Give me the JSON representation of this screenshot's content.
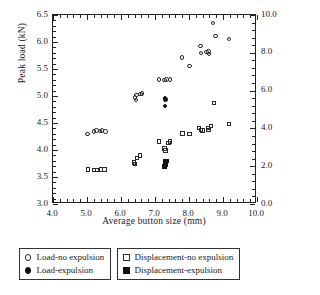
{
  "chart_data": {
    "type": "scatter",
    "title": "",
    "xlabel": "Average button size (mm)",
    "ylabel": "Peak load (kN)",
    "ylabel_right": "Maximum displacement (mm)",
    "xlim": [
      4.0,
      10.0
    ],
    "ylim": [
      3.0,
      6.5
    ],
    "ylim_right": [
      0.0,
      10.0
    ],
    "grid": false,
    "xticks": [
      "4.0",
      "5.0",
      "6.0",
      "7.0",
      "8.0",
      "9.0",
      "10.0"
    ],
    "yticks_left": [
      "3.0",
      "3.5",
      "4.0",
      "4.5",
      "5.0",
      "5.5",
      "6.0",
      "6.5"
    ],
    "yticks_right": [
      "0.0",
      "2.0",
      "4.0",
      "6.0",
      "8.0",
      "10.0"
    ],
    "legend_position": "below-plot",
    "series": [
      {
        "name": "Load-no expulsion",
        "marker": "circle-open",
        "axis": "left",
        "points": [
          [
            5.02,
            4.29
          ],
          [
            5.22,
            4.34
          ],
          [
            5.28,
            4.36
          ],
          [
            5.38,
            4.35
          ],
          [
            5.45,
            4.36
          ],
          [
            5.55,
            4.34
          ],
          [
            6.42,
            4.97
          ],
          [
            6.44,
            4.92
          ],
          [
            6.46,
            5.01
          ],
          [
            6.58,
            5.03
          ],
          [
            6.62,
            5.04
          ],
          [
            7.12,
            5.3
          ],
          [
            7.28,
            5.29
          ],
          [
            7.34,
            5.3
          ],
          [
            7.44,
            5.3
          ],
          [
            7.8,
            5.71
          ],
          [
            8.02,
            5.55
          ],
          [
            8.34,
            5.92
          ],
          [
            8.36,
            5.79
          ],
          [
            8.52,
            5.81
          ],
          [
            8.58,
            5.82
          ],
          [
            8.6,
            5.77
          ],
          [
            8.72,
            6.35
          ],
          [
            8.78,
            6.11
          ],
          [
            9.18,
            6.05
          ]
        ]
      },
      {
        "name": "Load-expulsion",
        "marker": "circle-filled",
        "axis": "left",
        "points": [
          [
            7.3,
            4.96
          ],
          [
            7.32,
            4.93
          ],
          [
            7.3,
            4.81
          ]
        ]
      },
      {
        "name": "Displacement-no expulsion",
        "marker": "square-open",
        "axis": "right",
        "points": [
          [
            5.04,
            1.82
          ],
          [
            5.22,
            1.78
          ],
          [
            5.3,
            1.8
          ],
          [
            5.42,
            1.82
          ],
          [
            5.52,
            1.82
          ],
          [
            6.38,
            2.18
          ],
          [
            6.42,
            2.12
          ],
          [
            6.48,
            2.42
          ],
          [
            6.56,
            2.56
          ],
          [
            7.12,
            3.3
          ],
          [
            7.28,
            2.92
          ],
          [
            7.32,
            2.82
          ],
          [
            7.4,
            3.22
          ],
          [
            7.44,
            3.3
          ],
          [
            7.82,
            3.72
          ],
          [
            8.02,
            3.68
          ],
          [
            8.3,
            4.02
          ],
          [
            8.36,
            3.92
          ],
          [
            8.4,
            3.88
          ],
          [
            8.56,
            4.0
          ],
          [
            8.58,
            3.92
          ],
          [
            8.66,
            4.12
          ],
          [
            8.74,
            5.32
          ],
          [
            9.18,
            4.22
          ]
        ]
      },
      {
        "name": "Displacement-expulsion",
        "marker": "square-filled",
        "axis": "right",
        "points": [
          [
            7.3,
            2.28
          ],
          [
            7.34,
            2.26
          ],
          [
            7.3,
            2.12
          ],
          [
            7.32,
            2.04
          ],
          [
            7.28,
            1.98
          ]
        ]
      }
    ]
  },
  "legend": {
    "left_box": [
      {
        "label": "Load-no expulsion",
        "marker": "circle-open"
      },
      {
        "label": "Load-expulsion",
        "marker": "circle-filled"
      }
    ],
    "right_box": [
      {
        "label": "Displacement-no expulsion",
        "marker": "square-open"
      },
      {
        "label": "Displacement-expulsion",
        "marker": "square-filled"
      }
    ]
  }
}
